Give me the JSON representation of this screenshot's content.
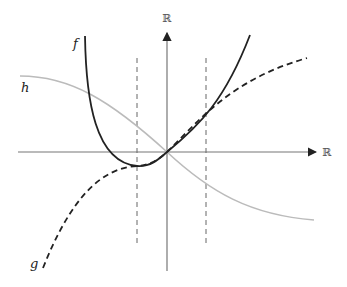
{
  "diagram": {
    "axes": {
      "x_label": "ℝ",
      "y_label": "ℝ",
      "color": "#777777"
    },
    "functions": [
      {
        "name": "f",
        "label": "f",
        "style": "solid",
        "color": "#222222",
        "description": "convex curve through origin, steep on left, minimum near left dashed line"
      },
      {
        "name": "g",
        "label": "g",
        "style": "dashed",
        "color": "#222222",
        "description": "increasing concave curve through origin"
      },
      {
        "name": "h",
        "label": "h",
        "style": "solid",
        "color": "#bbbbbb",
        "description": "decreasing sigmoid-like curve through origin"
      }
    ],
    "guides": [
      {
        "name": "left-vertical-guide",
        "style": "dashed"
      },
      {
        "name": "right-vertical-guide",
        "style": "dashed"
      }
    ]
  }
}
